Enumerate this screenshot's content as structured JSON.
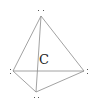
{
  "diagram": {
    "title": "",
    "shape": "tetrahedron",
    "center_label": "C",
    "line_color": "#8a8a8a",
    "vertices": [
      {
        "id": "top",
        "x": 41,
        "y": 16,
        "marker": ".."
      },
      {
        "id": "left",
        "x": 13,
        "y": 71,
        "marker": ":"
      },
      {
        "id": "right",
        "x": 84,
        "y": 71,
        "marker": ":"
      },
      {
        "id": "bottom",
        "x": 36,
        "y": 92,
        "marker": ".."
      }
    ],
    "edges": [
      [
        "top",
        "left"
      ],
      [
        "top",
        "right"
      ],
      [
        "top",
        "bottom"
      ],
      [
        "left",
        "right"
      ],
      [
        "left",
        "bottom"
      ],
      [
        "right",
        "bottom"
      ]
    ]
  }
}
